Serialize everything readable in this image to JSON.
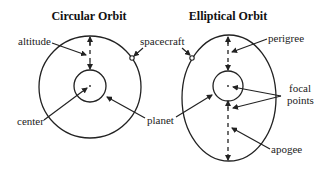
{
  "diagrams": [
    {
      "title": "Circular Orbit",
      "labels": {
        "altitude": "altitude",
        "spacecraft": "spacecraft",
        "center": "center",
        "planet": "planet"
      }
    },
    {
      "title": "Elliptical Orbit",
      "labels": {
        "perigee": "perigree",
        "focal_line1": "focal",
        "focal_line2": "points",
        "planet": "planet",
        "apogee": "apogee",
        "spacecraft": "spacecraft"
      }
    }
  ],
  "colors": {
    "stroke": "#222222",
    "background": "#ffffff"
  }
}
